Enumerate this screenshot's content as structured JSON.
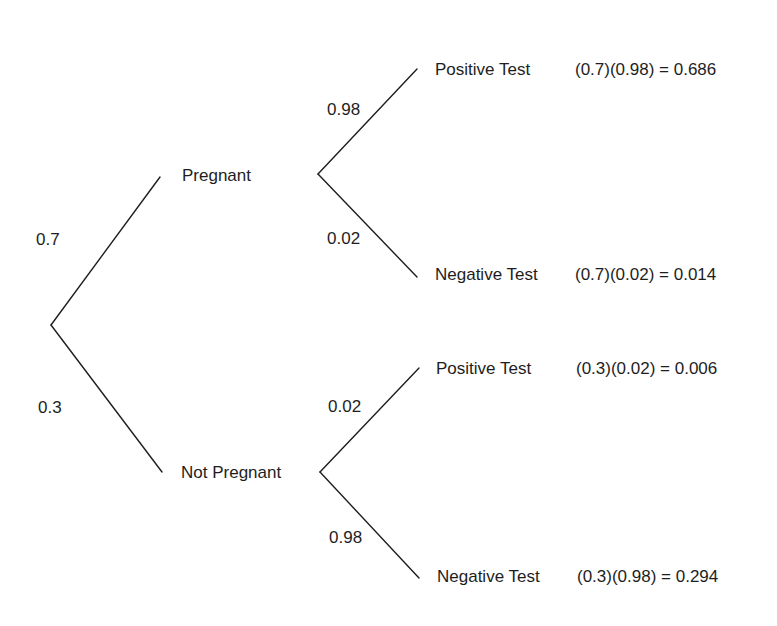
{
  "diagram": {
    "type": "probability-tree",
    "root": {
      "branches": [
        {
          "probability": "0.7",
          "outcome": "Pregnant",
          "branches": [
            {
              "probability": "0.98",
              "outcome": "Positive Test",
              "joint": "(0.7)(0.98) = 0.686"
            },
            {
              "probability": "0.02",
              "outcome": "Negative Test",
              "joint": "(0.7)(0.02) = 0.014"
            }
          ]
        },
        {
          "probability": "0.3",
          "outcome": "Not Pregnant",
          "branches": [
            {
              "probability": "0.02",
              "outcome": "Positive Test",
              "joint": "(0.3)(0.02) = 0.006"
            },
            {
              "probability": "0.98",
              "outcome": "Negative Test",
              "joint": "(0.3)(0.98) = 0.294"
            }
          ]
        }
      ]
    },
    "colors": {
      "line": "#1e1e1e",
      "text": "#1e1e1e",
      "background": "#ffffff"
    }
  }
}
